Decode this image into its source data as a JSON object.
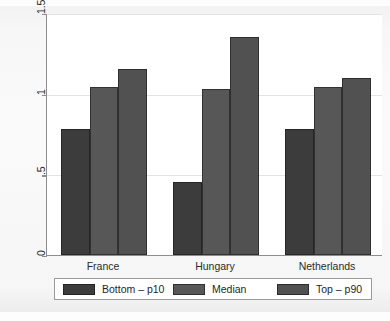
{
  "chart_data": {
    "type": "bar",
    "title": "",
    "subtitle": "",
    "xlabel": "",
    "ylabel": "",
    "categories": [
      "France",
      "Hungary",
      "Netherlands"
    ],
    "series": [
      {
        "name": "Bottom – p10",
        "color": "#3c3c3c",
        "values": [
          0.78,
          0.45,
          0.78
        ]
      },
      {
        "name": "Median",
        "color": "#575757",
        "values": [
          1.04,
          1.03,
          1.04
        ]
      },
      {
        "name": "Top – p90",
        "color": "#515151",
        "values": [
          1.15,
          1.35,
          1.1
        ]
      }
    ],
    "ylim": [
      0,
      1.5
    ],
    "yticks": [
      0,
      0.5,
      1,
      1.5
    ],
    "ytick_labels": [
      "0",
      ".5",
      "1",
      "1.5"
    ],
    "ytick_labels_rotated": true,
    "grid": true,
    "grid_axis": "y",
    "legend_position": "bottom",
    "bar_group_gap": true
  },
  "legend": {
    "entries": [
      {
        "label": "Bottom – p10",
        "color": "#3c3c3c"
      },
      {
        "label": "Median",
        "color": "#575757"
      },
      {
        "label": "Top – p90",
        "color": "#515151"
      }
    ]
  },
  "axis": {
    "y_tick_labels": [
      "1.5",
      "1",
      ".5",
      "0"
    ],
    "x_tick_labels": [
      "France",
      "Hungary",
      "Netherlands"
    ]
  },
  "colors": {
    "background": "#fdfdfd",
    "plot_background": "#ffffff",
    "axis_line": "#8d8d8d",
    "gridline": "#e3e3e3",
    "text": "#2b2b2b"
  }
}
